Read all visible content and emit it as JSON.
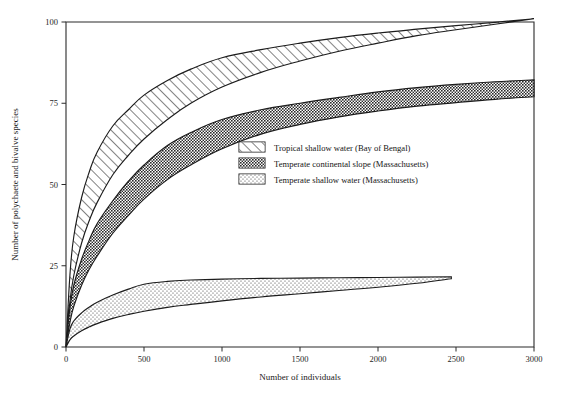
{
  "chart_data": {
    "type": "area",
    "title": "",
    "subtitle": "",
    "xlabel": "Number of individuals",
    "ylabel": "Number of polychaete and bivalve species",
    "xlim": [
      0,
      3000
    ],
    "ylim": [
      0,
      100
    ],
    "xticks": [
      0,
      500,
      1000,
      1500,
      2000,
      2500,
      3000
    ],
    "xticklabels": [
      "0",
      "500",
      "1000",
      "1500",
      "2000",
      "2500",
      "3000"
    ],
    "yticks": [
      0,
      25,
      50,
      75,
      100
    ],
    "yticklabels": [
      "0",
      "25",
      "50",
      "75",
      "100"
    ],
    "grid": false,
    "legend_position": "center-right",
    "series": [
      {
        "name": "Tropical shallow water (Bay of Bengal)",
        "fill": "diagonal-hatch",
        "color": "#1c1c1c",
        "upper": [
          [
            0,
            0
          ],
          [
            25,
            22
          ],
          [
            50,
            34
          ],
          [
            100,
            46
          ],
          [
            150,
            54
          ],
          [
            200,
            60
          ],
          [
            300,
            68
          ],
          [
            400,
            73
          ],
          [
            500,
            77.5
          ],
          [
            650,
            82
          ],
          [
            800,
            85.5
          ],
          [
            1000,
            89
          ],
          [
            1250,
            91.5
          ],
          [
            1500,
            93.5
          ],
          [
            1750,
            95.2
          ],
          [
            2000,
            96.6
          ],
          [
            2250,
            97.8
          ],
          [
            2500,
            98.9
          ],
          [
            2750,
            99.9
          ],
          [
            3000,
            101
          ]
        ],
        "lower": [
          [
            0,
            0
          ],
          [
            25,
            14
          ],
          [
            50,
            22
          ],
          [
            100,
            32
          ],
          [
            150,
            39
          ],
          [
            200,
            44.5
          ],
          [
            300,
            53
          ],
          [
            400,
            59
          ],
          [
            500,
            64
          ],
          [
            650,
            70
          ],
          [
            800,
            75
          ],
          [
            1000,
            80
          ],
          [
            1250,
            84.5
          ],
          [
            1500,
            88
          ],
          [
            1750,
            91
          ],
          [
            2000,
            93.5
          ],
          [
            2250,
            95.8
          ],
          [
            2500,
            97.6
          ],
          [
            2750,
            99.3
          ],
          [
            3000,
            101
          ]
        ]
      },
      {
        "name": "Temperate continental slope (Massachusetts)",
        "fill": "dense-checker",
        "color": "#1c1c1c",
        "upper": [
          [
            0,
            0
          ],
          [
            25,
            12
          ],
          [
            50,
            19
          ],
          [
            100,
            27
          ],
          [
            150,
            33
          ],
          [
            200,
            38
          ],
          [
            300,
            45
          ],
          [
            400,
            51
          ],
          [
            500,
            56
          ],
          [
            650,
            62
          ],
          [
            800,
            66
          ],
          [
            1000,
            70
          ],
          [
            1250,
            73
          ],
          [
            1500,
            75
          ],
          [
            1750,
            76.8
          ],
          [
            2000,
            78.5
          ],
          [
            2250,
            79.8
          ],
          [
            2500,
            80.8
          ],
          [
            2750,
            81.6
          ],
          [
            3000,
            82.2
          ]
        ],
        "lower": [
          [
            0,
            0
          ],
          [
            25,
            7.5
          ],
          [
            50,
            12.5
          ],
          [
            100,
            19
          ],
          [
            150,
            24
          ],
          [
            200,
            28
          ],
          [
            300,
            35
          ],
          [
            400,
            40.5
          ],
          [
            500,
            45.5
          ],
          [
            650,
            51.5
          ],
          [
            800,
            56
          ],
          [
            1000,
            61
          ],
          [
            1250,
            65.5
          ],
          [
            1500,
            68.5
          ],
          [
            1750,
            70.8
          ],
          [
            2000,
            72.6
          ],
          [
            2250,
            74.1
          ],
          [
            2500,
            75.2
          ],
          [
            2750,
            76.2
          ],
          [
            3000,
            77
          ]
        ]
      },
      {
        "name": "Temperate shallow water (Massachusetts)",
        "fill": "sparse-dots",
        "color": "#1c1c1c",
        "upper": [
          [
            0,
            0
          ],
          [
            25,
            5.5
          ],
          [
            50,
            8
          ],
          [
            100,
            10.5
          ],
          [
            150,
            12.3
          ],
          [
            200,
            13.8
          ],
          [
            300,
            16
          ],
          [
            400,
            17.8
          ],
          [
            500,
            19.3
          ],
          [
            650,
            20.2
          ],
          [
            800,
            20.6
          ],
          [
            1000,
            20.9
          ],
          [
            1250,
            21.1
          ],
          [
            1500,
            21.2
          ],
          [
            1750,
            21.3
          ],
          [
            2000,
            21.4
          ],
          [
            2250,
            21.5
          ],
          [
            2470,
            21.6
          ]
        ],
        "lower": [
          [
            0,
            0
          ],
          [
            25,
            2.2
          ],
          [
            50,
            3.4
          ],
          [
            100,
            5
          ],
          [
            150,
            6.2
          ],
          [
            200,
            7.2
          ],
          [
            300,
            8.8
          ],
          [
            400,
            10
          ],
          [
            500,
            11
          ],
          [
            650,
            12.2
          ],
          [
            800,
            13.1
          ],
          [
            1000,
            14.2
          ],
          [
            1250,
            15.4
          ],
          [
            1500,
            16.4
          ],
          [
            1750,
            17.4
          ],
          [
            2000,
            18.4
          ],
          [
            2250,
            19.6
          ],
          [
            2470,
            21.0
          ]
        ]
      }
    ]
  },
  "legend": {
    "items": [
      {
        "label": "Tropical shallow water (Bay of Bengal)",
        "pattern": "diagonal-hatch"
      },
      {
        "label": "Temperate continental slope (Massachusetts)",
        "pattern": "dense-checker"
      },
      {
        "label": "Temperate shallow water (Massachusetts)",
        "pattern": "sparse-dots"
      }
    ]
  },
  "colors": {
    "axis": "#2b2b2b",
    "ink": "#1c1c1c",
    "background": "#ffffff"
  }
}
